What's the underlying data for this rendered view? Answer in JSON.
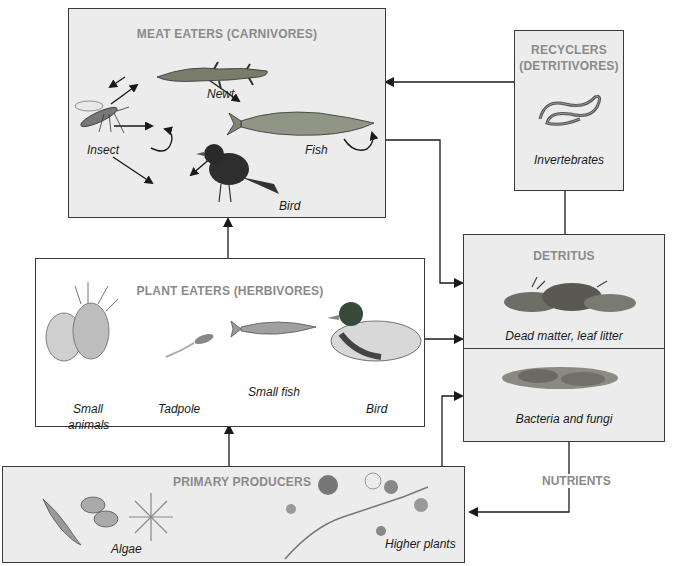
{
  "diagram": {
    "type": "food web",
    "boxes": {
      "carnivores": {
        "title": "MEAT EATERS (CARNIVORES)",
        "organisms": [
          "Newt",
          "Insect",
          "Fish",
          "Bird"
        ]
      },
      "detritivores": {
        "title_line1": "RECYCLERS",
        "title_line2": "(DETRITIVORES)",
        "organisms": [
          "Invertebrates"
        ]
      },
      "herbivores": {
        "title": "PLANT EATERS (HERBIVORES)",
        "organisms": [
          "Small",
          "animals",
          "Tadpole",
          "Small fish",
          "Bird"
        ]
      },
      "detritus": {
        "title": "DETRITUS",
        "sections": [
          "Dead matter, leaf litter",
          "Bacteria and fungi"
        ]
      },
      "producers": {
        "title": "PRIMARY PRODUCERS",
        "organisms": [
          "Algae",
          "Higher plants"
        ]
      }
    },
    "connector_label": "NUTRIENTS",
    "colors": {
      "box_fill": "#ececec",
      "border": "#3a3a3a",
      "title_text": "#8a8a8a",
      "arrow": "#1a1a1a"
    }
  }
}
